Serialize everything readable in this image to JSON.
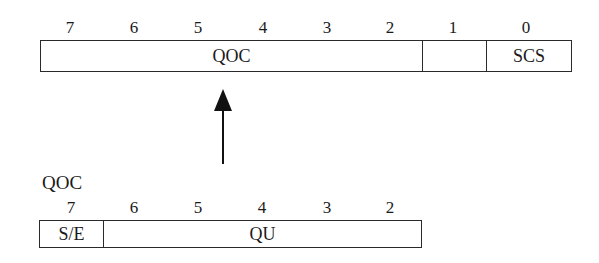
{
  "top_register": {
    "bit_numbers": [
      "7",
      "6",
      "5",
      "4",
      "3",
      "2",
      "1",
      "0"
    ],
    "fields": [
      {
        "name": "QOC",
        "bits": "7-2"
      },
      {
        "name": "",
        "bits": "1"
      },
      {
        "name": "SCS",
        "bits": "0"
      }
    ]
  },
  "arrow": {
    "direction": "up",
    "from": "QOC detail",
    "to": "QOC field"
  },
  "bottom_register": {
    "title": "QOC",
    "bit_numbers": [
      "7",
      "6",
      "5",
      "4",
      "3",
      "2"
    ],
    "fields": [
      {
        "name": "S/E",
        "bits": "7"
      },
      {
        "name": "QU",
        "bits": "6-2"
      }
    ]
  },
  "colors": {
    "line": "#2a2a2a",
    "text": "#1a1a1a",
    "background": "#ffffff"
  }
}
